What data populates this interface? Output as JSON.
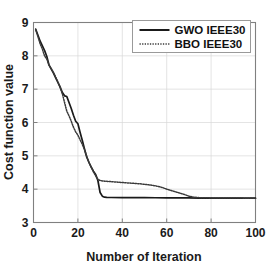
{
  "chart_data": {
    "type": "line",
    "title": "",
    "xlabel": "Number of Iteration",
    "ylabel": "Cost function value",
    "xlim": [
      0,
      100
    ],
    "ylim": [
      3,
      9
    ],
    "xticks": [
      0,
      20,
      40,
      60,
      80,
      100
    ],
    "yticks": [
      3,
      4,
      5,
      6,
      7,
      8,
      9
    ],
    "xticklabels": [
      "0",
      "20",
      "40",
      "60",
      "80",
      "100"
    ],
    "yticklabels": [
      "3",
      "4",
      "5",
      "6",
      "7",
      "8",
      "9"
    ],
    "grid": true,
    "grid_color": "#d9d9d9",
    "axes_color": "#808080",
    "background": "#ffffff",
    "legend": {
      "position": "upper right",
      "entries": [
        {
          "label": "GWO IEEE30",
          "style": "solid",
          "color": "#1a1a1a"
        },
        {
          "label": "BBO IEEE30",
          "style": "dotted",
          "color": "#3a3a3a"
        }
      ]
    },
    "series": [
      {
        "name": "GWO IEEE30",
        "style": "solid",
        "color": "#1a1a1a",
        "x": [
          1,
          2,
          3,
          4,
          5,
          6,
          7,
          8,
          9,
          10,
          11,
          12,
          13,
          14,
          15,
          16,
          17,
          18,
          19,
          20,
          21,
          22,
          23,
          24,
          25,
          26,
          27,
          28,
          29,
          30,
          31,
          32,
          33,
          35,
          40,
          45,
          50,
          55,
          60,
          65,
          70,
          75,
          80,
          85,
          90,
          95,
          100
        ],
        "y": [
          8.8,
          8.62,
          8.44,
          8.3,
          8.16,
          7.98,
          7.72,
          7.6,
          7.48,
          7.34,
          7.2,
          7.06,
          6.9,
          6.8,
          6.78,
          6.6,
          6.42,
          6.22,
          6.04,
          5.96,
          5.7,
          5.46,
          5.2,
          4.96,
          4.8,
          4.66,
          4.54,
          4.44,
          4.26,
          3.9,
          3.79,
          3.76,
          3.755,
          3.75,
          3.748,
          3.746,
          3.744,
          3.742,
          3.74,
          3.738,
          3.736,
          3.734,
          3.733,
          3.732,
          3.731,
          3.73,
          3.73
        ]
      },
      {
        "name": "BBO IEEE30",
        "style": "dotted",
        "color": "#3a3a3a",
        "x": [
          1,
          2,
          3,
          4,
          5,
          6,
          7,
          8,
          9,
          10,
          11,
          12,
          13,
          14,
          15,
          16,
          17,
          18,
          19,
          20,
          21,
          22,
          23,
          24,
          25,
          26,
          27,
          28,
          29,
          30,
          32,
          34,
          36,
          38,
          40,
          44,
          48,
          52,
          55,
          58,
          60,
          62,
          64,
          66,
          68,
          70,
          72,
          75,
          80,
          85,
          90,
          95,
          100
        ],
        "y": [
          8.78,
          8.58,
          8.36,
          8.2,
          8.0,
          7.9,
          7.72,
          7.62,
          7.5,
          7.36,
          7.22,
          7.06,
          6.86,
          6.6,
          6.34,
          6.2,
          6.04,
          5.86,
          5.72,
          5.62,
          5.48,
          5.34,
          5.18,
          4.98,
          4.8,
          4.66,
          4.52,
          4.4,
          4.3,
          4.26,
          4.24,
          4.23,
          4.22,
          4.21,
          4.2,
          4.18,
          4.16,
          4.13,
          4.1,
          4.05,
          4.0,
          3.96,
          3.92,
          3.88,
          3.84,
          3.79,
          3.76,
          3.745,
          3.738,
          3.735,
          3.733,
          3.731,
          3.73
        ]
      }
    ]
  }
}
